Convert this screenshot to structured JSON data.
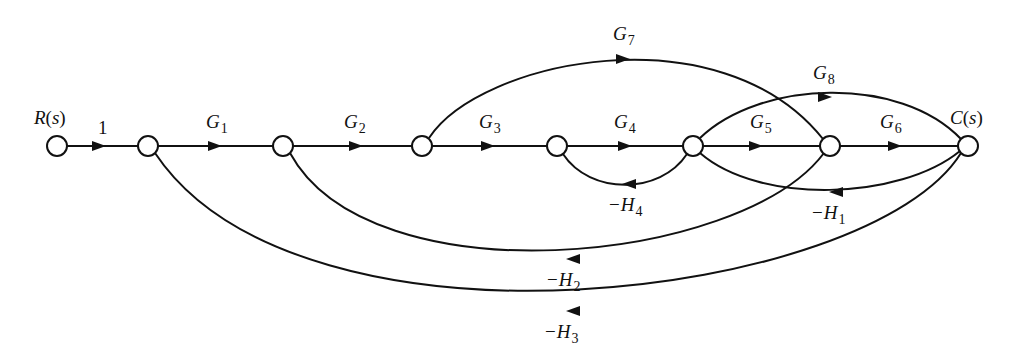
{
  "diagram": {
    "type": "signal-flow-graph",
    "input_label": {
      "main": "R",
      "paren_open": "(",
      "arg": "s",
      "paren_close": ")"
    },
    "output_label": {
      "main": "C",
      "paren_open": "(",
      "arg": "s",
      "paren_close": ")"
    },
    "nodes": [
      {
        "id": 0,
        "x": 57,
        "y": 146,
        "role": "input"
      },
      {
        "id": 1,
        "x": 148,
        "y": 146
      },
      {
        "id": 2,
        "x": 283,
        "y": 146
      },
      {
        "id": 3,
        "x": 422,
        "y": 146
      },
      {
        "id": 4,
        "x": 557,
        "y": 146
      },
      {
        "id": 5,
        "x": 693,
        "y": 146
      },
      {
        "id": 6,
        "x": 830,
        "y": 146
      },
      {
        "id": 7,
        "x": 968,
        "y": 146,
        "role": "output"
      }
    ],
    "edges": {
      "unity": {
        "text": "1",
        "from": 0,
        "to": 1
      },
      "G1": {
        "sign": "",
        "main": "G",
        "sub": "1",
        "from": 1,
        "to": 2
      },
      "G2": {
        "sign": "",
        "main": "G",
        "sub": "2",
        "from": 2,
        "to": 3
      },
      "G3": {
        "sign": "",
        "main": "G",
        "sub": "3",
        "from": 3,
        "to": 4
      },
      "G4": {
        "sign": "",
        "main": "G",
        "sub": "4",
        "from": 4,
        "to": 5
      },
      "G5": {
        "sign": "",
        "main": "G",
        "sub": "5",
        "from": 5,
        "to": 6
      },
      "G6": {
        "sign": "",
        "main": "G",
        "sub": "6",
        "from": 6,
        "to": 7
      },
      "G7": {
        "sign": "",
        "main": "G",
        "sub": "7",
        "from": 3,
        "to": 6
      },
      "G8": {
        "sign": "",
        "main": "G",
        "sub": "8",
        "from": 5,
        "to": 7
      },
      "H1": {
        "sign": "−",
        "main": "H",
        "sub": "1",
        "from": 7,
        "to": 5
      },
      "H2": {
        "sign": "−",
        "main": "H",
        "sub": "2",
        "from": 6,
        "to": 2
      },
      "H3": {
        "sign": "−",
        "main": "H",
        "sub": "3",
        "from": 7,
        "to": 1
      },
      "H4": {
        "sign": "−",
        "main": "H",
        "sub": "4",
        "from": 5,
        "to": 4
      }
    },
    "colors": {
      "stroke": "#111111",
      "background": "#ffffff"
    }
  }
}
